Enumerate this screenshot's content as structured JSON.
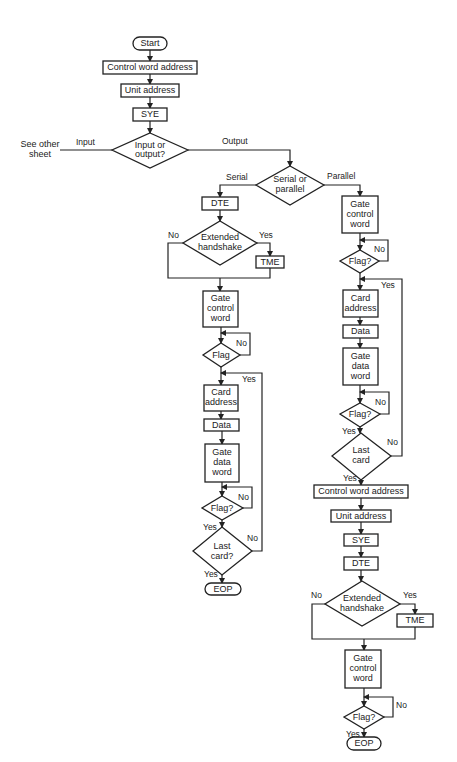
{
  "diagram": {
    "type": "flowchart",
    "nodes": {
      "start": "Start",
      "cwa1": "Control word address",
      "ua1": "Unit address",
      "sye1": "SYE",
      "io": [
        "Input or",
        "output?"
      ],
      "see_other": [
        "See other",
        "sheet"
      ],
      "sp": [
        "Serial or",
        "parallel"
      ],
      "dte_s": "DTE",
      "eh_s": [
        "Extended",
        "handshake"
      ],
      "tme_s": "TME",
      "gcw_s": [
        "Gate",
        "control",
        "word"
      ],
      "flag_s1": "Flag",
      "card_s": [
        "Card",
        "address"
      ],
      "data_s": "Data",
      "gdw_s": [
        "Gate",
        "data",
        "word"
      ],
      "flag_s2": "Flag?",
      "last_s": [
        "Last",
        "card?"
      ],
      "eop_s": "EOP",
      "gcw_p": [
        "Gate",
        "control",
        "word"
      ],
      "flag_p1": "Flag?",
      "card_p": [
        "Card",
        "address"
      ],
      "data_p": "Data",
      "gdw_p": [
        "Gate",
        "data",
        "word"
      ],
      "flag_p2": "Flag?",
      "last_p": [
        "Last",
        "card"
      ],
      "cwa2": "Control word address",
      "ua2": "Unit address",
      "sye2": "SYE",
      "dte2": "DTE",
      "eh2": [
        "Extended",
        "handshake"
      ],
      "tme2": "TME",
      "gcw2": [
        "Gate",
        "control",
        "word"
      ],
      "flag3": "Flag?",
      "eop2": "EOP"
    },
    "edge_labels": {
      "input": "Input",
      "output": "Output",
      "serial": "Serial",
      "parallel": "Parallel",
      "no": "No",
      "yes": "Yes"
    }
  }
}
